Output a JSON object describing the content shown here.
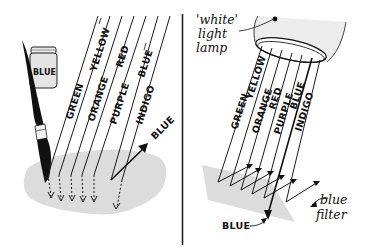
{
  "left_panel": {
    "title": "Paint absorbs all colours except blue",
    "jar_label": "BLUE",
    "ray_labels": [
      "GREEN",
      "YELLOW",
      "ORANGE",
      "RED",
      "PURPLE",
      "BLUE",
      "INDIGO"
    ],
    "reflected_label": "BLUE"
  },
  "right_panel": {
    "lamp_label_line1": "'white'",
    "lamp_label_line2": "light",
    "lamp_label_line3": "lamp",
    "ray_labels": [
      "GREEN",
      "YELLOW",
      "ORANGE",
      "RED",
      "PURPLE",
      "BLUE",
      "INDIGO"
    ],
    "filter_label_line1": "blue",
    "filter_label_line2": "filter",
    "transmitted_label": "BLUE"
  },
  "colors": {
    "ink": "#111111",
    "surface_gray": "#dcdcdc",
    "lamp_gray": "#ececec",
    "background": "#ffffff"
  }
}
